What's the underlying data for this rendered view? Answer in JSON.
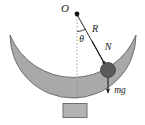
{
  "figure": {
    "background_color": "#ffffff",
    "labels": {
      "pivot": "O",
      "radius": "R",
      "normal_force": "N",
      "angle": "θ",
      "weight": "mg"
    },
    "colors": {
      "bowl_fill": "#a9a9a9",
      "bowl_stroke": "#6e6e6e",
      "ball_fill": "#5a5a5a",
      "ball_stroke": "#3c3c3c",
      "pedestal_fill": "#b2b2b2",
      "pedestal_stroke": "#6e6e6e",
      "line_stroke": "#2b2b2b",
      "dotted_stroke": "#8c8c8c",
      "text_color": "#1a1a1a"
    },
    "geometry": {
      "pivot_point": [
        77,
        14
      ],
      "ball_center": [
        108,
        70
      ],
      "ball_radius": 7.5,
      "bowl_inner_radius": 56,
      "bowl_left_tip": [
        10,
        35
      ],
      "bowl_right_tip": [
        136,
        35
      ],
      "pedestal": [
        63,
        104,
        24,
        14
      ],
      "dotted_line_end": [
        77,
        100
      ],
      "theta_arc_radius": 17,
      "angle_degrees": 29
    },
    "elements": [
      "bowl-crescent",
      "pedestal-base",
      "pivot-dot",
      "dotted-vertical-line",
      "radius-line",
      "theta-arc",
      "normal-force-arrow",
      "weight-arrow",
      "ball"
    ]
  }
}
